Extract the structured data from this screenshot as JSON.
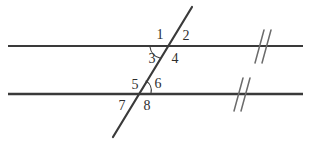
{
  "figure": {
    "background_color": "#ffffff",
    "line_color": "#3a3a3a",
    "tick_color": "#6b6b6b",
    "label_color": "#2e2e2e",
    "arc_color": "#3a3a3a",
    "width": 311,
    "height": 144
  },
  "lines": {
    "parallel_top": {
      "name": "upper parallel line",
      "x1": 8,
      "y1": 46,
      "x2": 303,
      "y2": 46,
      "stroke_width": 2.2
    },
    "parallel_bottom": {
      "name": "lower parallel line",
      "x1": 8,
      "y1": 94,
      "x2": 303,
      "y2": 94,
      "stroke_width": 2.6
    },
    "transversal": {
      "name": "transversal line",
      "x1": 192,
      "y1": 7,
      "x2": 113,
      "y2": 137,
      "stroke_width": 2.2
    }
  },
  "intersections": {
    "upper": {
      "x": 168,
      "y": 46
    },
    "lower": {
      "x": 139,
      "y": 94
    }
  },
  "angle_labels": [
    {
      "id": "angle-1",
      "text": "1",
      "x": 160,
      "y": 35
    },
    {
      "id": "angle-2",
      "text": "2",
      "x": 186,
      "y": 36
    },
    {
      "id": "angle-3",
      "text": "3",
      "x": 152,
      "y": 59
    },
    {
      "id": "angle-4",
      "text": "4",
      "x": 175,
      "y": 59
    },
    {
      "id": "angle-5",
      "text": "5",
      "x": 135,
      "y": 85
    },
    {
      "id": "angle-6",
      "text": "6",
      "x": 158,
      "y": 84
    },
    {
      "id": "angle-7",
      "text": "7",
      "x": 122,
      "y": 106
    },
    {
      "id": "angle-8",
      "text": "8",
      "x": 147,
      "y": 106
    }
  ],
  "angle_arcs": [
    {
      "id": "arc-angle-3",
      "label_ref": "3",
      "description": "large arc marking angle 3 below the upper line, left of the transversal",
      "path": "M 150 47 A 13 13 0 0 0 160 58",
      "stroke_width": 1.1
    },
    {
      "id": "arc-angle-6",
      "label_ref": "6",
      "description": "small arc marking angle 6 above the lower line, right of the transversal",
      "path": "M 146 81 A 11 11 0 0 1 151 93",
      "stroke_width": 1.1
    }
  ],
  "parallel_marks": {
    "description": "double hash marks indicating the two lines are parallel",
    "top": {
      "id": "parallel-mark-top",
      "center_x": 266,
      "center_y": 46,
      "strokes": [
        {
          "x1": 264,
          "y1": 30,
          "x2": 255,
          "y2": 63
        },
        {
          "x1": 271,
          "y1": 30,
          "x2": 262,
          "y2": 63
        }
      ]
    },
    "bottom": {
      "id": "parallel-mark-bottom",
      "center_x": 243,
      "center_y": 94,
      "strokes": [
        {
          "x1": 243,
          "y1": 78,
          "x2": 234,
          "y2": 111
        },
        {
          "x1": 250,
          "y1": 78,
          "x2": 241,
          "y2": 111
        }
      ]
    }
  }
}
